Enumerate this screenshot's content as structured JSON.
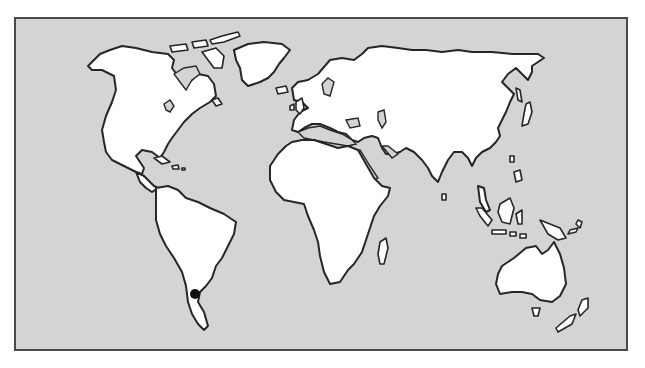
{
  "map": {
    "type": "world-outline-map",
    "background_color": "#d4d4d4",
    "land_color": "#ffffff",
    "outline_color": "#262626",
    "frame_color": "#4a4a4a",
    "continents": [
      "North America",
      "South America",
      "Europe",
      "Africa",
      "Asia",
      "Australia",
      "Greenland"
    ],
    "markers": [
      {
        "name": "location-marker",
        "region": "South America (Patagonia / southern Argentina)",
        "x": 193,
        "y": 292,
        "color": "#111111"
      }
    ]
  }
}
